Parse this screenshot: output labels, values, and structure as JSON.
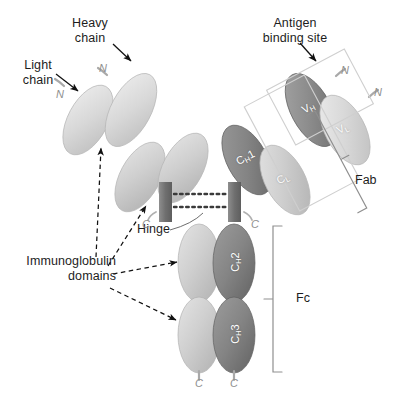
{
  "figure": {
    "type": "diagram",
    "background": "#ffffff"
  },
  "colors": {
    "heavy_chain": "#8a8a8a",
    "heavy_chain_dark": "#6e6e6e",
    "light_chain": "#c9c9c9",
    "light_chain_light": "#dcdcdc",
    "stem": "#7a7a7a",
    "label_text": "#1d1d1d",
    "terminus_text": "#8f8f8f",
    "domain_text": "#ffffff",
    "bracket": "#9a9a9a",
    "arrow": "#111111"
  },
  "callouts": {
    "heavy_chain": "Heavy\nchain",
    "light_chain": "Light\nchain",
    "antigen_binding_site": "Antigen\nbinding site",
    "immunoglobulin_domains": "Immunoglobulin\ndomains",
    "hinge": "Hinge"
  },
  "regions": {
    "fab": "Fab",
    "fc": "Fc"
  },
  "domains": {
    "vh": {
      "label": "V",
      "sub": "H",
      "chain": "heavy",
      "description": "variable heavy"
    },
    "vl": {
      "label": "V",
      "sub": "L",
      "chain": "light",
      "description": "variable light"
    },
    "ch1": {
      "label": "C",
      "sub": "H",
      "num": "1",
      "chain": "heavy",
      "description": "constant heavy 1"
    },
    "cl": {
      "label": "C",
      "sub": "L",
      "chain": "light",
      "description": "constant light"
    },
    "ch2": {
      "label": "C",
      "sub": "H",
      "num": "2",
      "chain": "heavy",
      "description": "constant heavy 2"
    },
    "ch3": {
      "label": "C",
      "sub": "H",
      "num": "3",
      "chain": "heavy",
      "description": "constant heavy 3"
    }
  },
  "termini": {
    "n": "N",
    "c": "C",
    "n_count": 4,
    "c_count": 4
  },
  "bonds": {
    "disulfide_count": 2,
    "style": "dotted"
  }
}
